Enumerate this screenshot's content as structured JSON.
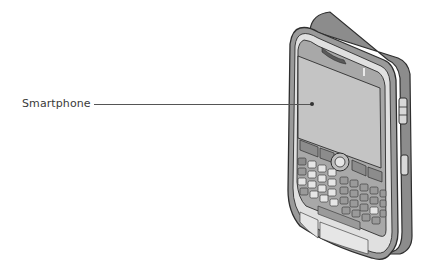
{
  "diagram": {
    "labels": [
      {
        "text": "Smartphone",
        "points_to": "screen"
      }
    ]
  },
  "colors": {
    "body_dark": "#8c8c8c",
    "bezel": "#a8a8a8",
    "screen": "#c4c4c4",
    "keys_light": "#e6e6e6",
    "keys_dark": "#9a9a9a",
    "outline": "#2e2e2e",
    "label_text": "#3a3a3a",
    "leader_line": "#555555"
  }
}
